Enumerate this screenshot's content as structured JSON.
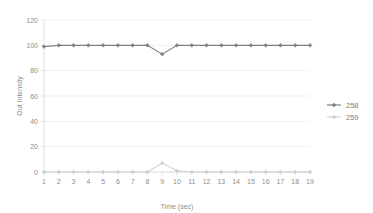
{
  "chart_data": {
    "type": "line",
    "title": "",
    "xlabel": "Time (sec)",
    "ylabel": "Out Intensity",
    "x": [
      1,
      2,
      3,
      4,
      5,
      6,
      7,
      8,
      9,
      10,
      11,
      12,
      13,
      14,
      15,
      16,
      17,
      18,
      19
    ],
    "xtick_labels": [
      "1",
      "2",
      "3",
      "4",
      "5",
      "6",
      "7",
      "8",
      "9",
      "10",
      "11",
      "12",
      "13",
      "14",
      "15",
      "16",
      "17",
      "18",
      "19"
    ],
    "ytick_labels": [
      "0",
      "20",
      "40",
      "60",
      "80",
      "100",
      "120"
    ],
    "ytick_values": [
      0,
      20,
      40,
      60,
      80,
      100,
      120
    ],
    "ylim": [
      0,
      120
    ],
    "xlim": [
      1,
      19
    ],
    "grid": "horizontal",
    "legend_position": "right",
    "series": [
      {
        "name": "258",
        "color": "#808080",
        "marker": "diamond",
        "values": [
          99,
          100,
          100,
          100,
          100,
          100,
          100,
          100,
          93,
          100,
          100,
          100,
          100,
          100,
          100,
          100,
          100,
          100,
          100
        ]
      },
      {
        "name": "259",
        "color": "#d0d0d0",
        "marker": "diamond",
        "values": [
          0,
          0,
          0,
          0,
          0,
          0,
          0,
          0,
          7,
          1,
          0,
          0,
          0,
          0,
          0,
          0,
          0,
          0,
          0
        ]
      }
    ]
  },
  "legend": {
    "entries": [
      {
        "label": "258"
      },
      {
        "label": "259"
      }
    ]
  },
  "axes": {
    "x_title": "Time (sec)",
    "y_title": "Out Intensity"
  },
  "colors": {
    "series_258": "#808080",
    "series_259": "#d0d0d0",
    "gridline": "#eaeaea",
    "axis": "#d9d9d9",
    "text": "#8d8d8d",
    "background": "#ffffff"
  }
}
